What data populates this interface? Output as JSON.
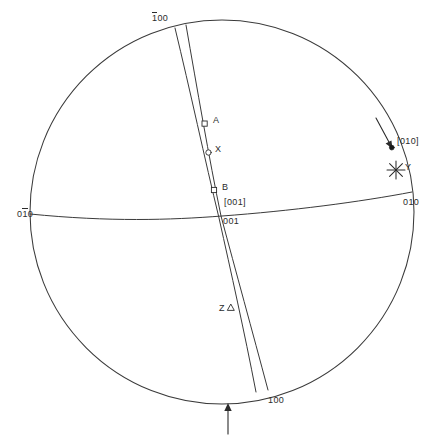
{
  "figure": {
    "kind": "stereographic-projection",
    "background": "#ffffff",
    "line_color": "#3a3a3a",
    "text_color": "#2b2b2b",
    "circle": {
      "cx": 222,
      "cy": 212,
      "r": 192
    }
  },
  "pole_labels": {
    "top": {
      "text": "100",
      "overbar_index": 0,
      "x": 152,
      "y": 14
    },
    "bottom": {
      "text": "100",
      "overbar_index": -1,
      "x": 268,
      "y": 396
    },
    "left": {
      "text": "010",
      "overbar_index": 1,
      "x": 18,
      "y": 210
    },
    "right": {
      "text": "010",
      "overbar_index": -1,
      "x": 404,
      "y": 198
    },
    "center_bracket": {
      "text": "[001]",
      "x": 224,
      "y": 199
    },
    "center_plain": {
      "text": "001",
      "x": 223,
      "y": 218
    },
    "direction_010": {
      "text": "[010]",
      "x": 397,
      "y": 137
    }
  },
  "markers": [
    {
      "name": "A",
      "label": "A",
      "symbol": "open-square",
      "x": 205,
      "y": 124,
      "label_x": 213,
      "label_y": 117
    },
    {
      "name": "X",
      "label": "X",
      "symbol": "open-circle",
      "x": 209,
      "y": 152,
      "label_x": 215,
      "label_y": 146
    },
    {
      "name": "B",
      "label": "B",
      "symbol": "open-square",
      "x": 214,
      "y": 190,
      "label_x": 222,
      "label_y": 184
    },
    {
      "name": "Z",
      "label": "Z",
      "symbol": "open-triangle",
      "x": 231,
      "y": 308,
      "label_x": 219,
      "label_y": 305
    },
    {
      "name": "Y",
      "label": "Y",
      "symbol": "asterisk-star",
      "x": 396,
      "y": 170,
      "label_x": 404,
      "label_y": 163
    },
    {
      "name": "pole-010",
      "label": "",
      "symbol": "filled-dot",
      "x": 392,
      "y": 148,
      "label_x": 0,
      "label_y": 0
    }
  ],
  "arrows": {
    "bottom_up": {
      "name": "bottom-index-arrow",
      "x": 228,
      "y_start": 434,
      "y_end": 404
    },
    "to_010": {
      "name": "pointer-arrow-to-010",
      "x1": 379,
      "y1": 124,
      "x2": 392,
      "y2": 147
    }
  },
  "curves": {
    "horizontal_great_circle": "01-bar-0 to 010 trace",
    "great_circle_1": "1-bar-00 to 100 trace (left of pair)",
    "great_circle_2": "1-bar-00 to 100 trace (right of pair)"
  }
}
